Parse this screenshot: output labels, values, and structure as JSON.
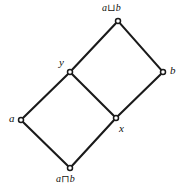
{
  "diagram": {
    "type": "hasse-diagram",
    "background_color": "#ffffff",
    "edge_color": "#1a1a1a",
    "node_fill_color": "#ffffff",
    "node_stroke_color": "#1a1a1a",
    "nodes": [
      {
        "id": "join",
        "label": "a⊔b",
        "x": 118,
        "y": 21,
        "label_x": 102,
        "label_y": 3,
        "label_anchor": "above"
      },
      {
        "id": "b",
        "label": "b",
        "x": 163,
        "y": 72,
        "label_x": 170,
        "label_y": 65,
        "label_anchor": "right"
      },
      {
        "id": "y",
        "label": "y",
        "x": 70,
        "y": 72,
        "label_x": 59,
        "label_y": 57,
        "label_anchor": "above-left"
      },
      {
        "id": "x",
        "label": "x",
        "x": 116,
        "y": 118,
        "label_x": 119,
        "label_y": 123,
        "label_anchor": "below-right"
      },
      {
        "id": "a",
        "label": "a",
        "x": 21,
        "y": 120,
        "label_x": 9,
        "label_y": 113,
        "label_anchor": "left"
      },
      {
        "id": "meet",
        "label": "a⊓b",
        "x": 70,
        "y": 168,
        "label_x": 56,
        "label_y": 174,
        "label_anchor": "below"
      }
    ],
    "edges": [
      {
        "from": "y",
        "to": "join"
      },
      {
        "from": "join",
        "to": "b"
      },
      {
        "from": "b",
        "to": "x"
      },
      {
        "from": "x",
        "to": "y"
      },
      {
        "from": "a",
        "to": "y"
      },
      {
        "from": "meet",
        "to": "a"
      },
      {
        "from": "meet",
        "to": "x"
      }
    ]
  }
}
